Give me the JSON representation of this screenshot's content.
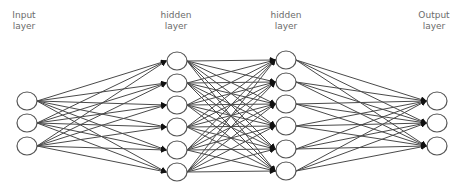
{
  "diagram": {
    "type": "feedforward-neural-network",
    "edge_color": "#4a4a4a",
    "node_stroke": "#555555",
    "node_fill": "#ffffff",
    "label_color": "#6b6b6b",
    "layers": [
      {
        "id": "input",
        "label_line1": "Input",
        "label_line2": "layer",
        "x": 27,
        "label_x": 24,
        "nodes_y": [
          101,
          123,
          146
        ]
      },
      {
        "id": "hidden1",
        "label_line1": "hidden",
        "label_line2": "layer",
        "x": 177,
        "label_x": 176,
        "nodes_y": [
          61,
          83,
          105,
          127,
          150,
          172
        ]
      },
      {
        "id": "hidden2",
        "label_line1": "hidden",
        "label_line2": "layer",
        "x": 286,
        "label_x": 286,
        "nodes_y": [
          60,
          82,
          104,
          126,
          149,
          171
        ]
      },
      {
        "id": "output",
        "label_line1": "Output",
        "label_line2": "layer",
        "x": 437,
        "label_x": 434,
        "nodes_y": [
          101,
          123,
          146
        ]
      }
    ],
    "connectivity": "fully-connected",
    "arrowheads": true
  }
}
